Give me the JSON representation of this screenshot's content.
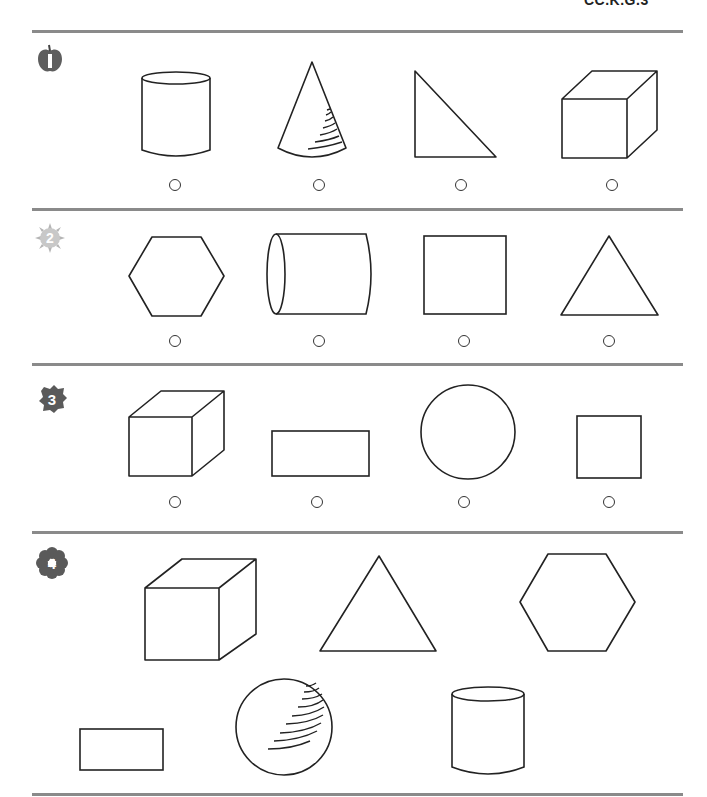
{
  "header": {
    "standard_code": "CC.K.G.3"
  },
  "problems": [
    {
      "number": "1",
      "badge_icon": "apple-icon",
      "prompt_type": "mark the odd one out",
      "choices": [
        {
          "shape": "cylinder",
          "dimension": "3D"
        },
        {
          "shape": "cone",
          "dimension": "3D"
        },
        {
          "shape": "right triangle",
          "dimension": "2D"
        },
        {
          "shape": "cube",
          "dimension": "3D"
        }
      ]
    },
    {
      "number": "2",
      "badge_icon": "sun-icon",
      "prompt_type": "mark the odd one out",
      "choices": [
        {
          "shape": "hexagon",
          "dimension": "2D"
        },
        {
          "shape": "cylinder (horizontal)",
          "dimension": "3D"
        },
        {
          "shape": "square",
          "dimension": "2D"
        },
        {
          "shape": "triangle",
          "dimension": "2D"
        }
      ]
    },
    {
      "number": "3",
      "badge_icon": "leaf-icon",
      "prompt_type": "mark the odd one out",
      "choices": [
        {
          "shape": "cube",
          "dimension": "3D"
        },
        {
          "shape": "rectangle",
          "dimension": "2D"
        },
        {
          "shape": "circle",
          "dimension": "2D"
        },
        {
          "shape": "square",
          "dimension": "2D"
        }
      ]
    },
    {
      "number": "4",
      "badge_icon": "flower-icon",
      "prompt_type": "sort shapes",
      "shapes": [
        {
          "shape": "cube",
          "dimension": "3D"
        },
        {
          "shape": "triangle",
          "dimension": "2D"
        },
        {
          "shape": "hexagon",
          "dimension": "2D"
        },
        {
          "shape": "rectangle",
          "dimension": "2D"
        },
        {
          "shape": "sphere",
          "dimension": "3D"
        },
        {
          "shape": "cylinder",
          "dimension": "3D"
        }
      ]
    }
  ],
  "colors": {
    "ink": "#222222",
    "divider": "#8a8a8a",
    "badge": "#6b6b6b"
  }
}
